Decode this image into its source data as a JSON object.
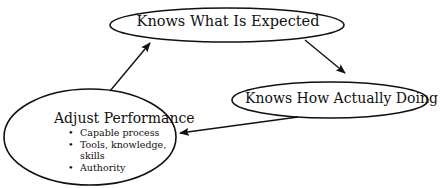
{
  "diagram": {
    "type": "cycle",
    "nodes": [
      {
        "id": "expected",
        "label": "Knows What Is Expected"
      },
      {
        "id": "actual",
        "label": "Knows How Actually Doing"
      },
      {
        "id": "adjust",
        "label": "Adjust Performance",
        "bullets": [
          "Capable process",
          "Tools, knowledge, skills",
          "Authority"
        ],
        "bullet_lines": [
          "Capable process",
          "Tools, knowledge,",
          "skills",
          "Authority"
        ]
      }
    ],
    "edges": [
      {
        "from": "expected",
        "to": "actual"
      },
      {
        "from": "actual",
        "to": "adjust"
      },
      {
        "from": "adjust",
        "to": "expected"
      }
    ],
    "colors": {
      "stroke": "#111111",
      "background": "#ffffff"
    }
  }
}
